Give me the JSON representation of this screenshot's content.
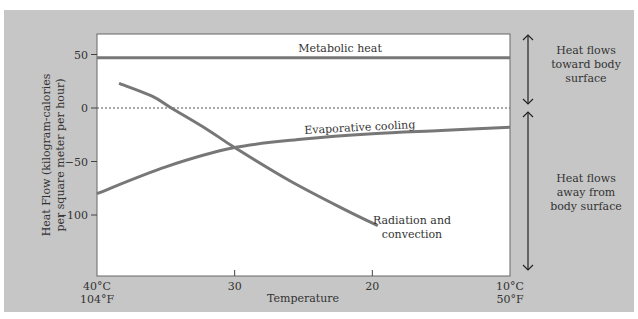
{
  "chart_data": {
    "type": "line",
    "title": "",
    "xlabel": "Temperature",
    "ylabel": "Heat Flow (kilogram-calories per square meter per hour)",
    "ylabel_line1": "Heat Flow (kilogram-calories",
    "ylabel_line2": "per square meter per hour)",
    "xlim": [
      40,
      10
    ],
    "ylim": [
      -150,
      60
    ],
    "x_ticks": [
      {
        "value": 40,
        "label": "40°C",
        "sublabel": "104°F"
      },
      {
        "value": 30,
        "label": "30",
        "sublabel": ""
      },
      {
        "value": 20,
        "label": "20",
        "sublabel": ""
      },
      {
        "value": 10,
        "label": "10°C",
        "sublabel": "50°F"
      }
    ],
    "y_ticks": [
      {
        "value": 50,
        "label": "50"
      },
      {
        "value": 0,
        "label": "0"
      },
      {
        "value": -50,
        "label": "−50"
      },
      {
        "value": -100,
        "label": "−100"
      }
    ],
    "zero_line": "dotted",
    "series": [
      {
        "name": "Metabolic heat",
        "x": [
          40,
          10
        ],
        "y": [
          47,
          47
        ]
      },
      {
        "name": "Evaporative cooling",
        "x": [
          40,
          35,
          30,
          25,
          20,
          15,
          10
        ],
        "y": [
          -80,
          -55,
          -37,
          -29,
          -24,
          -21,
          -18
        ]
      },
      {
        "name": "Radiation and convection",
        "x": [
          38.4,
          36,
          34.6,
          32,
          30,
          26,
          22,
          19.6
        ],
        "y": [
          23,
          11,
          0,
          -20,
          -37,
          -68,
          -95,
          -110
        ]
      }
    ],
    "annotations": [
      {
        "text": "Heat flows toward body surface",
        "lines": [
          "Heat flows",
          "toward body",
          "surface"
        ]
      },
      {
        "text": "Heat flows away from body surface",
        "lines": [
          "Heat flows",
          "away from",
          "body surface"
        ]
      }
    ]
  }
}
